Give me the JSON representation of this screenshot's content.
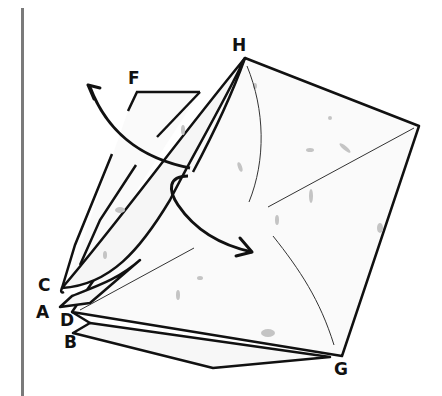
{
  "diagram": {
    "type": "origami-fold-step",
    "labels": {
      "H": "H",
      "F": "F",
      "C": "C",
      "A": "A",
      "D": "D",
      "B": "B",
      "G": "G"
    },
    "arrows": [
      {
        "name": "lift-flap-arrow",
        "direction": "up-left"
      },
      {
        "name": "fold-flap-arrow",
        "direction": "down-right"
      }
    ],
    "colors": {
      "paper": "#fafafa",
      "speckle": "#bdbdbd",
      "outline": "#111111",
      "crease": "#333333",
      "divider": "#7a7a7a"
    }
  }
}
